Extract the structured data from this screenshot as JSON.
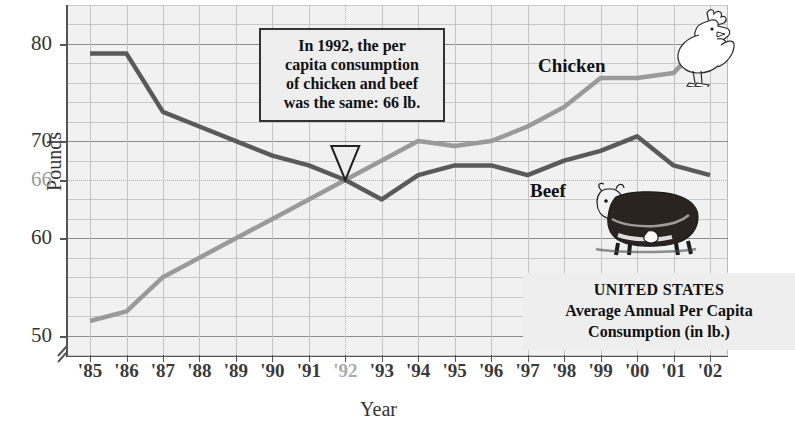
{
  "axes": {
    "y_title": "Pounds",
    "x_title": "Year",
    "y_ticks": [
      {
        "value": 80,
        "label": "80",
        "gray": false
      },
      {
        "value": 70,
        "label": "70",
        "gray": false
      },
      {
        "value": 66,
        "label": "66",
        "gray": true
      },
      {
        "value": 60,
        "label": "60",
        "gray": false
      },
      {
        "value": 50,
        "label": "50",
        "gray": false
      }
    ],
    "x_ticks": [
      {
        "label": "'85",
        "gray": false
      },
      {
        "label": "'86",
        "gray": false
      },
      {
        "label": "'87",
        "gray": false
      },
      {
        "label": "'88",
        "gray": false
      },
      {
        "label": "'89",
        "gray": false
      },
      {
        "label": "'90",
        "gray": false
      },
      {
        "label": "'91",
        "gray": false
      },
      {
        "label": "'92",
        "gray": true
      },
      {
        "label": "'93",
        "gray": false
      },
      {
        "label": "'94",
        "gray": false
      },
      {
        "label": "'95",
        "gray": false
      },
      {
        "label": "'96",
        "gray": false
      },
      {
        "label": "'97",
        "gray": false
      },
      {
        "label": "'98",
        "gray": false
      },
      {
        "label": "'99",
        "gray": false
      },
      {
        "label": "'00",
        "gray": false
      },
      {
        "label": "'01",
        "gray": false
      },
      {
        "label": "'02",
        "gray": false
      }
    ],
    "y_axis_break": true
  },
  "callout": {
    "lines": [
      "In 1992, the per",
      "capita consumption",
      "of chicken and beef",
      "was the same: 66 lb."
    ]
  },
  "caption": {
    "line1": "UNITED STATES",
    "line2": "Average Annual Per Capita",
    "line3": "Consumption (in lb.)"
  },
  "series_labels": {
    "chicken": "Chicken",
    "beef": "Beef"
  },
  "icons": {
    "chicken": "rooster-icon",
    "beef": "cow-icon"
  },
  "colors": {
    "beef_line": "#5a5a5a",
    "chicken_line": "#9a9a9a",
    "plot_background": "#f1f1f1",
    "grid_major": "#8d8d8d",
    "grid_minor": "#c9c9c9",
    "callout_background": "#eeeeee",
    "highlight_gray": "#a9a9a9"
  },
  "chart_data": {
    "type": "line",
    "title": "UNITED STATES Average Annual Per Capita Consumption (in lb.)",
    "xlabel": "Year",
    "ylabel": "Pounds",
    "ylim": [
      48,
      84
    ],
    "xlim": [
      "'85",
      "'02"
    ],
    "grid": true,
    "legend": "in-plot labels",
    "x": [
      "'85",
      "'86",
      "'87",
      "'88",
      "'89",
      "'90",
      "'91",
      "'92",
      "'93",
      "'94",
      "'95",
      "'96",
      "'97",
      "'98",
      "'99",
      "'00",
      "'01",
      "'02"
    ],
    "series": [
      {
        "name": "Beef",
        "color": "#5a5a5a",
        "values": [
          79,
          79,
          73,
          71.5,
          70,
          68.5,
          67.5,
          66,
          64,
          66.5,
          67.5,
          67.5,
          66.5,
          68,
          69,
          70.5,
          67.5,
          66.5
        ]
      },
      {
        "name": "Chicken",
        "color": "#9a9a9a",
        "values": [
          51.5,
          52.5,
          56,
          58,
          60,
          62,
          64,
          66,
          68,
          70,
          69.5,
          70,
          71.5,
          73.5,
          76.5,
          76.5,
          77,
          81
        ]
      }
    ],
    "annotations": [
      {
        "text": "In 1992, the per capita consumption of chicken and beef was the same: 66 lb.",
        "points_to": {
          "x": "'92",
          "y": 66
        }
      }
    ]
  }
}
